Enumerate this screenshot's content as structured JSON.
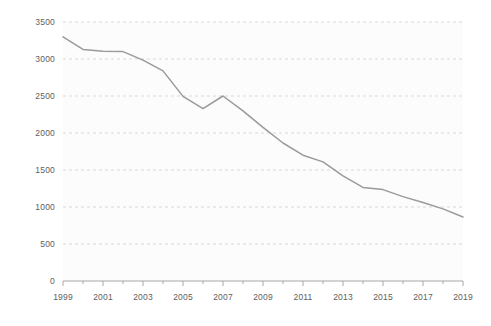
{
  "chart_data": {
    "type": "line",
    "title": "",
    "subtitle": "",
    "xlabel": "",
    "ylabel": "",
    "xlim": [
      1999,
      2019
    ],
    "ylim": [
      0,
      3500
    ],
    "grid": "horizontal-dashed",
    "legend": "none",
    "x": [
      1999,
      2000,
      2001,
      2002,
      2003,
      2004,
      2005,
      2006,
      2007,
      2008,
      2009,
      2010,
      2011,
      2012,
      2013,
      2014,
      2015,
      2016,
      2017,
      2018,
      2019
    ],
    "series": [
      {
        "name": "series-1",
        "color": "#9a9a9a",
        "values": [
          3300,
          3130,
          3105,
          3100,
          2985,
          2840,
          2495,
          2330,
          2500,
          2300,
          2075,
          1865,
          1700,
          1610,
          1420,
          1265,
          1235,
          1140,
          1060,
          975,
          865
        ]
      }
    ],
    "y_ticks": [
      0,
      500,
      1000,
      1500,
      2000,
      2500,
      3000,
      3500
    ],
    "y_tick_labels": [
      "0",
      "500",
      "1000",
      "1500",
      "2000",
      "2500",
      "3000",
      "3500"
    ],
    "x_ticks": [
      1999,
      2001,
      2003,
      2005,
      2007,
      2009,
      2011,
      2013,
      2015,
      2017,
      2019
    ],
    "x_tick_labels": [
      "1999",
      "2001",
      "2003",
      "2005",
      "2007",
      "2009",
      "2011",
      "2013",
      "2015",
      "2017",
      "2019"
    ],
    "x_minor_ticks": [
      2000,
      2002,
      2004,
      2006,
      2008,
      2010,
      2012,
      2014,
      2016,
      2018
    ],
    "colors": {
      "background": "#ffffff",
      "panel": "#fcfcfc",
      "gridline": "#cfcfcf",
      "axis": "#9e9e9e",
      "tick_text": "#5e5e5e",
      "line": "#9a9a9a"
    }
  }
}
